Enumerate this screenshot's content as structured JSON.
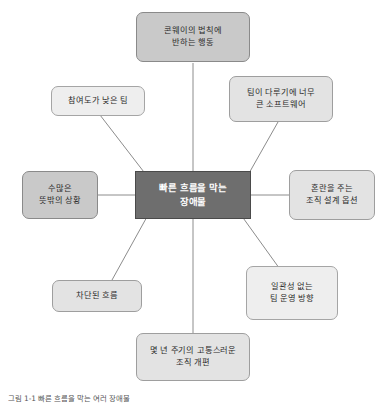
{
  "diagram": {
    "center": {
      "label": "빠른 흐름을 막는\n장애물",
      "fill": "#6e6e6e",
      "text_color": "#ffffff"
    },
    "nodes": [
      {
        "id": "conway-violation",
        "label": "콘웨이의 법칙에\n반하는 행동",
        "position": "top",
        "fill": "#c9c9c9"
      },
      {
        "id": "oversized-software",
        "label": "팀이 다루기에 너무\n큰 소프트웨어",
        "position": "top-right",
        "fill": "#e3e3e3"
      },
      {
        "id": "confusing-org-design",
        "label": "혼란을 주는\n조직 설계 옵션",
        "position": "right",
        "fill": "#e3e3e3"
      },
      {
        "id": "inconsistent-direction",
        "label": "일관성 없는\n팀 운영 방향",
        "position": "bottom-right",
        "fill": "#eeeeee"
      },
      {
        "id": "painful-reorg",
        "label": "몇 년 주기의 고통스러운\n조직 개편",
        "position": "bottom",
        "fill": "#e3e3e3"
      },
      {
        "id": "blocked-flow",
        "label": "차단된 흐름",
        "position": "bottom-left",
        "fill": "#e3e3e3"
      },
      {
        "id": "many-surprises",
        "label": "수많은\n뜻밖의 상황",
        "position": "left",
        "fill": "#c9c9c9"
      },
      {
        "id": "low-engagement-team",
        "label": "참여도가 낮은 팀",
        "position": "top-left",
        "fill": "#eeeeee"
      }
    ],
    "connector_color": "#8c8c8c"
  },
  "caption": {
    "text": "그림 1-1  빠른 흐름을 막는 여러 장애물"
  }
}
